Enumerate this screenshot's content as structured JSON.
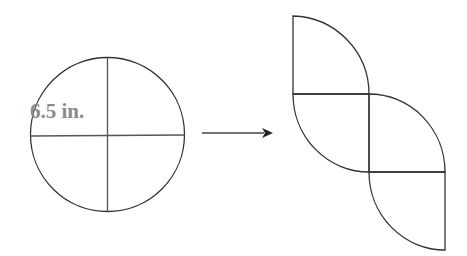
{
  "diagram": {
    "circle_label": "6.5 in.",
    "colors": {
      "stroke": "#333333",
      "label": "#8a8a8a",
      "background": "#ffffff"
    },
    "left_figure": "circle divided into four quarters",
    "arrow": "right-pointing arrow",
    "right_figure": "four quarter-circle sectors arranged in a staggered diagonal"
  }
}
